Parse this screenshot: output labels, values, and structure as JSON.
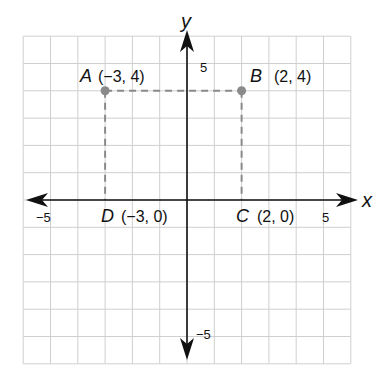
{
  "figure": {
    "type": "coordinate-plane",
    "axes": {
      "x_label": "x",
      "y_label": "y",
      "x_range": [
        -6,
        6
      ],
      "y_range": [
        -6,
        6
      ],
      "grid_step": 1,
      "x_tick_labels": [
        {
          "value": -5,
          "text": "−5"
        },
        {
          "value": 5,
          "text": "5"
        }
      ],
      "y_tick_labels": [
        {
          "value": 5,
          "text": "5"
        },
        {
          "value": -5,
          "text": "−5"
        }
      ]
    },
    "points": [
      {
        "name": "A",
        "x": -3,
        "y": 4,
        "coord_text": "(−3, 4)",
        "dot": true
      },
      {
        "name": "B",
        "x": 2,
        "y": 4,
        "coord_text": "(2, 4)",
        "dot": true
      },
      {
        "name": "C",
        "x": 2,
        "y": 0,
        "coord_text": "(2, 0)",
        "dot": false
      },
      {
        "name": "D",
        "x": -3,
        "y": 0,
        "coord_text": "(−3, 0)",
        "dot": false
      }
    ],
    "dashed_segments": [
      [
        "A",
        "B"
      ],
      [
        "A",
        "D"
      ],
      [
        "B",
        "C"
      ]
    ],
    "colors": {
      "grid": "#cfcfcf",
      "axis": "#111111",
      "dashed": "#8a8a8a",
      "point": "#8a8a8a"
    }
  }
}
